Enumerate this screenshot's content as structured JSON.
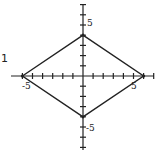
{
  "figure": {
    "type": "coordinate-plane-diagram",
    "margin_label": "1",
    "axes": {
      "x_range": [
        -6.5,
        7
      ],
      "y_range": [
        -7,
        7
      ],
      "tick_step": 1,
      "labels": {
        "x_neg": "-5",
        "x_pos": "5",
        "y_pos": "5",
        "y_neg": "-5"
      }
    },
    "shape": {
      "name": "rhombus",
      "vertices": [
        {
          "x": -6,
          "y": 0
        },
        {
          "x": 0,
          "y": 4
        },
        {
          "x": 6,
          "y": 0
        },
        {
          "x": 0,
          "y": -4
        }
      ],
      "stroke": "#222222"
    },
    "colors": {
      "ink": "#222222",
      "background": "#ffffff"
    }
  }
}
